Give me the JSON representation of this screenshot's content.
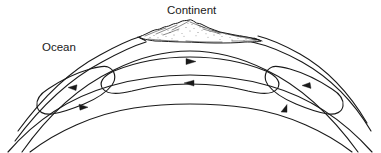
{
  "figure": {
    "type": "cross-section-diagram",
    "background_color": "#ffffff",
    "line_color": "#1a1a1a",
    "width": 381,
    "height": 153
  },
  "labels": {
    "continent": "Continent",
    "ocean": "Ocean"
  },
  "label_positions": {
    "continent": {
      "x": 167,
      "y": 14
    },
    "ocean": {
      "x": 42,
      "y": 51
    }
  },
  "layers": [
    {
      "name": "surface-arc",
      "description": "outer crust surface arc"
    },
    {
      "name": "crust-base-arc",
      "description": "base of crust arc"
    },
    {
      "name": "upper-mantle-arc",
      "description": "top of convecting mantle"
    },
    {
      "name": "lower-mantle-arc",
      "description": "base of convecting mantle"
    },
    {
      "name": "deep-arc",
      "description": "deepest arc line"
    }
  ],
  "convection_cells": [
    {
      "name": "left-cell",
      "top_flow_direction": "left",
      "bottom_flow_direction": "right",
      "arrows": [
        {
          "label": "left-cell-top-arrow",
          "direction": "left",
          "x": 72,
          "y": 88
        },
        {
          "label": "left-cell-bottom-arrow",
          "direction": "right",
          "x": 82,
          "y": 110
        }
      ]
    },
    {
      "name": "center-cell",
      "top_flow_direction": "right",
      "bottom_flow_direction": "left",
      "arrows": [
        {
          "label": "center-cell-top-arrow",
          "direction": "right",
          "x": 189,
          "y": 62
        },
        {
          "label": "center-cell-bottom-arrow",
          "direction": "left",
          "x": 191,
          "y": 83
        }
      ]
    },
    {
      "name": "right-cell",
      "top_flow_direction": "left",
      "bottom_flow_direction": "right",
      "arrows": [
        {
          "label": "right-cell-top-arrow",
          "direction": "left",
          "x": 307,
          "y": 88
        },
        {
          "label": "right-cell-bottom-arrow",
          "direction": "right",
          "x": 291,
          "y": 108
        }
      ]
    }
  ],
  "continent": {
    "name": "continent-landmass",
    "style": "stippled-mountainous-relief",
    "span_x": [
      138,
      262
    ],
    "peak_y": 20
  }
}
